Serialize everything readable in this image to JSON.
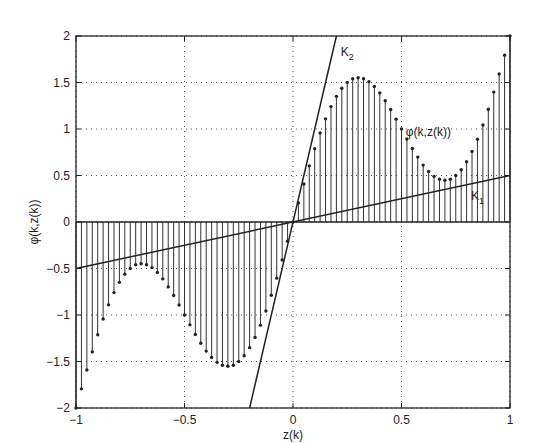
{
  "chart_data": {
    "type": "stem",
    "title": "",
    "xlabel": "z(k)",
    "ylabel": "φ(k,z(k))",
    "xlim": [
      -1,
      1
    ],
    "ylim": [
      -2,
      2
    ],
    "grid": true,
    "xticks": [
      -1,
      -0.5,
      0,
      0.5,
      1
    ],
    "xtick_labels": [
      "-1",
      "-0.5",
      "0",
      "0.5",
      "1"
    ],
    "yticks": [
      -2,
      -1.5,
      -1,
      -0.5,
      0,
      0.5,
      1,
      1.5,
      2
    ],
    "ytick_labels": [
      "-2",
      "-1.5",
      "-1",
      "-0.5",
      "0",
      "0.5",
      "1",
      "1.5",
      "2"
    ],
    "stem_series": {
      "name": "φ(k,z(k))",
      "x_start": -1,
      "x_end": 1,
      "x_step": 0.025,
      "approx_function": "phi(z) = 2z + sin(2*pi*z)",
      "x": [
        -1,
        -0.975,
        -0.95,
        -0.925,
        -0.9,
        -0.875,
        -0.85,
        -0.825,
        -0.8,
        -0.775,
        -0.75,
        -0.725,
        -0.7,
        -0.675,
        -0.65,
        -0.625,
        -0.6,
        -0.575,
        -0.55,
        -0.525,
        -0.5,
        -0.475,
        -0.45,
        -0.425,
        -0.4,
        -0.375,
        -0.35,
        -0.325,
        -0.3,
        -0.275,
        -0.25,
        -0.225,
        -0.2,
        -0.175,
        -0.15,
        -0.125,
        -0.1,
        -0.075,
        -0.05,
        -0.025,
        0,
        0.025,
        0.05,
        0.075,
        0.1,
        0.125,
        0.15,
        0.175,
        0.2,
        0.225,
        0.25,
        0.275,
        0.3,
        0.325,
        0.35,
        0.375,
        0.4,
        0.425,
        0.45,
        0.475,
        0.5,
        0.525,
        0.55,
        0.575,
        0.6,
        0.625,
        0.65,
        0.675,
        0.7,
        0.725,
        0.75,
        0.775,
        0.8,
        0.825,
        0.85,
        0.875,
        0.9,
        0.925,
        0.95,
        0.975,
        1
      ],
      "y": [
        -2.0,
        -1.794,
        -1.591,
        -1.397,
        -1.212,
        -1.043,
        -0.891,
        -0.759,
        -0.649,
        -0.562,
        -0.5,
        -0.459,
        -0.449,
        -0.459,
        -0.491,
        -0.543,
        -0.612,
        -0.698,
        -0.791,
        -0.893,
        -1.0,
        -1.106,
        -1.209,
        -1.303,
        -1.388,
        -1.457,
        -1.509,
        -1.541,
        -1.551,
        -1.541,
        -1.5,
        -1.438,
        -1.351,
        -1.241,
        -1.109,
        -0.957,
        -0.788,
        -0.604,
        -0.409,
        -0.206,
        0.0,
        0.206,
        0.409,
        0.604,
        0.788,
        0.957,
        1.109,
        1.241,
        1.351,
        1.438,
        1.5,
        1.541,
        1.551,
        1.541,
        1.509,
        1.457,
        1.388,
        1.303,
        1.209,
        1.106,
        1.0,
        0.893,
        0.791,
        0.698,
        0.612,
        0.543,
        0.491,
        0.459,
        0.449,
        0.459,
        0.5,
        0.562,
        0.649,
        0.759,
        0.891,
        1.043,
        1.212,
        1.397,
        1.591,
        1.794,
        2.0
      ]
    },
    "lines": [
      {
        "name": "K1",
        "slope": 0.5,
        "intercept": 0,
        "label": "K",
        "subscript": "1"
      },
      {
        "name": "K2",
        "slope": 10,
        "intercept": 0,
        "label": "K",
        "subscript": "2"
      }
    ],
    "annotations": [
      {
        "text": "φ(k,z(k))",
        "x": 0.52,
        "y": 0.93
      },
      {
        "text": "K",
        "sub": "2",
        "x": 0.22,
        "y": 1.78
      },
      {
        "text": "K",
        "sub": "1",
        "x": 0.82,
        "y": 0.24
      }
    ]
  }
}
